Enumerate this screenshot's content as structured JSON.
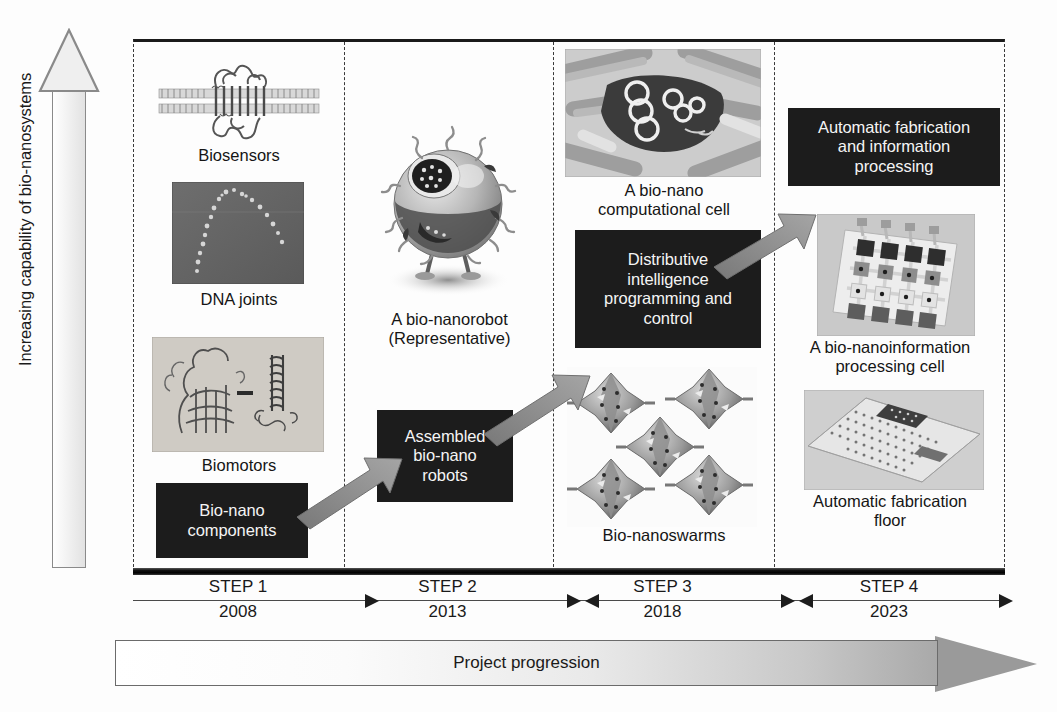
{
  "figure": {
    "vertical_axis_label": "Increasing capability of bio-nanosystems",
    "bottom_arrow_label": "Project progression"
  },
  "timeline": {
    "steps": [
      {
        "name": "STEP 1",
        "year": "2008"
      },
      {
        "name": "STEP 2",
        "year": "2013"
      },
      {
        "name": "STEP 3",
        "year": "2018"
      },
      {
        "name": "STEP 4",
        "year": "2023"
      }
    ]
  },
  "columns": {
    "step1": {
      "images": [
        {
          "name": "membrane-protein-biosensor-image",
          "caption": "Biosensors"
        },
        {
          "name": "dna-joints-afm-image",
          "caption": "DNA joints"
        },
        {
          "name": "biomotors-molecular-image",
          "caption": "Biomotors"
        }
      ],
      "box": "Bio-nano\ncomponents"
    },
    "step2": {
      "images": [
        {
          "name": "bio-nanorobot-render-image",
          "caption": "A bio-nanorobot\n(Representative)"
        }
      ],
      "box": "Assembled\nbio-nano\nrobots"
    },
    "step3": {
      "images": [
        {
          "name": "bio-nano-computational-cell-image",
          "caption": "A bio-nano\ncomputational cell"
        },
        {
          "name": "bio-nanoswarms-image",
          "caption": "Bio-nanoswarms"
        }
      ],
      "box": "Distributive\nintelligence\nprogramming and\ncontrol"
    },
    "step4": {
      "images": [
        {
          "name": "bio-nanoinformation-processing-cell-image",
          "caption": "A bio-nanoinformation\nprocessing cell"
        },
        {
          "name": "automatic-fabrication-floor-image",
          "caption": "Automatic fabrication\nfloor"
        }
      ],
      "box": "Automatic fabrication\nand information\nprocessing"
    }
  },
  "colors": {
    "box_fill": "#1c1c1c",
    "box_text": "#f4f4f4",
    "arrow_gray": "#8f8f8f",
    "frame_line": "#1b1b1b",
    "divider": "#3a3a3a"
  }
}
